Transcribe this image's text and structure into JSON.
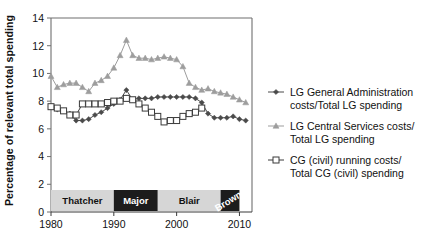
{
  "chart_data": {
    "type": "line",
    "title": "",
    "xlabel": "",
    "ylabel": "Percentage of relevant total spending",
    "xlim": [
      1980,
      2012
    ],
    "ylim": [
      0,
      14
    ],
    "ytick_values": [
      0,
      2,
      4,
      6,
      8,
      10,
      12,
      14
    ],
    "ytick_labels": [
      "0",
      "2",
      "4",
      "6",
      "8",
      "10",
      "12",
      "14"
    ],
    "xtick_values": [
      1980,
      1990,
      2000,
      2010
    ],
    "xtick_labels": [
      "1980",
      "1990",
      "2000",
      "2010"
    ],
    "grid": false,
    "legend_position": "right",
    "series": [
      {
        "name": "LG General Administration costs/Total LG spending",
        "marker": "diamond",
        "color": "#4a4a4a",
        "x": [
          1980,
          1981,
          1982,
          1983,
          1984,
          1985,
          1986,
          1987,
          1988,
          1989,
          1990,
          1991,
          1992,
          1993,
          1994,
          1995,
          1996,
          1997,
          1998,
          1999,
          2000,
          2001,
          2002,
          2003,
          2004,
          2005,
          2006,
          2007,
          2008,
          2009,
          2010,
          2011
        ],
        "y": [
          7.6,
          7.4,
          7.3,
          7.1,
          6.6,
          6.6,
          6.7,
          7.0,
          7.2,
          7.5,
          7.8,
          8.1,
          8.8,
          8.1,
          8.2,
          8.2,
          8.2,
          8.3,
          8.3,
          8.3,
          8.3,
          8.3,
          8.3,
          8.2,
          7.9,
          7.1,
          6.8,
          6.8,
          6.8,
          6.9,
          6.7,
          6.6
        ]
      },
      {
        "name": "LG Central Services costs/Total LG spending",
        "marker": "triangle",
        "color": "#9d9d9d",
        "x": [
          1980,
          1981,
          1982,
          1983,
          1984,
          1985,
          1986,
          1987,
          1988,
          1989,
          1990,
          1991,
          1992,
          1993,
          1994,
          1995,
          1996,
          1997,
          1998,
          1999,
          2000,
          2001,
          2002,
          2003,
          2004,
          2005,
          2006,
          2007,
          2008,
          2009,
          2010,
          2011
        ],
        "y": [
          9.8,
          9.0,
          9.2,
          9.3,
          9.3,
          9.0,
          8.7,
          9.3,
          9.5,
          9.8,
          10.4,
          11.3,
          12.4,
          11.3,
          11.1,
          11.1,
          11.0,
          11.1,
          11.2,
          11.1,
          11.0,
          10.5,
          9.3,
          9.0,
          8.8,
          8.9,
          8.7,
          8.6,
          8.5,
          8.3,
          8.1,
          7.9
        ]
      },
      {
        "name": "CG (civil) running costs/Total CG (civil) spending",
        "marker": "open-square",
        "color": "#3a3a3a",
        "x": [
          1980,
          1981,
          1982,
          1983,
          1984,
          1985,
          1986,
          1987,
          1988,
          1989,
          1990,
          1991,
          1992,
          1993,
          1994,
          1995,
          1996,
          1997,
          1998,
          1999,
          2000,
          2001,
          2002,
          2003,
          2004
        ],
        "y": [
          7.6,
          7.5,
          7.3,
          7.0,
          7.0,
          7.8,
          7.8,
          7.8,
          7.8,
          7.9,
          8.0,
          8.0,
          8.2,
          8.1,
          7.8,
          7.5,
          7.2,
          6.9,
          6.5,
          6.6,
          6.6,
          6.9,
          7.1,
          7.2,
          7.5
        ]
      }
    ],
    "era_bands": [
      {
        "label": "Thatcher",
        "start": 1980,
        "end": 1990,
        "style": "light"
      },
      {
        "label": "Major",
        "start": 1990,
        "end": 1997,
        "style": "dark"
      },
      {
        "label": "Blair",
        "start": 1997,
        "end": 2007,
        "style": "light"
      },
      {
        "label": "Brown",
        "start": 2007,
        "end": 2010,
        "style": "dark-rotated"
      }
    ]
  },
  "legend": {
    "items": [
      {
        "marker": "diamond",
        "line1": "LG General Administration",
        "line2": "costs/Total LG spending"
      },
      {
        "marker": "triangle",
        "line1": "LG Central Services costs/",
        "line2": "Total LG spending"
      },
      {
        "marker": "open-square",
        "line1": "CG (civil) running costs/",
        "line2": "Total CG (civil) spending"
      }
    ]
  },
  "axis": {
    "ylabel": "Percentage of relevant total spending"
  }
}
